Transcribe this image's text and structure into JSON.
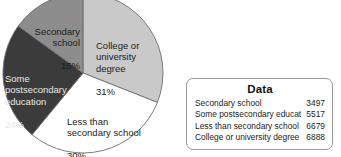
{
  "chart_data": {
    "type": "pie",
    "title": "",
    "legend_position": "labels-on-slices",
    "categories": [
      "College or university degree",
      "Less than secondary school",
      "Some postsecondary education",
      "Secondary school"
    ],
    "values": [
      31,
      30,
      24,
      15
    ],
    "value_unit": "percent",
    "counts": [
      6888,
      6679,
      5517,
      3497
    ],
    "slices": [
      {
        "label": "College or\nuniversity\ndegree",
        "label_flat": "College or university degree",
        "percent_text": "31%",
        "percent": 31,
        "count": 6888,
        "color": "#c9c9c9",
        "start_angle": 0,
        "end_angle": 111.6,
        "text_color": "dark"
      },
      {
        "label": "Less than\nsecondary school",
        "label_flat": "Less than secondary school",
        "percent_text": "30%",
        "percent": 30,
        "count": 6679,
        "color": "#ffffff",
        "start_angle": 111.6,
        "end_angle": 219.6,
        "text_color": "dark"
      },
      {
        "label": "Some\npostsecondary\neducation",
        "label_flat": "Some postsecondary education",
        "percent_text": "24%",
        "percent": 24,
        "count": 5517,
        "color": "#3b3b3b",
        "start_angle": 219.6,
        "end_angle": 306.0,
        "text_color": "light"
      },
      {
        "label": "Secondary\nschool",
        "label_flat": "Secondary school",
        "percent_text": "15%",
        "percent": 15,
        "count": 3497,
        "color": "#8d8d8d",
        "start_angle": 306.0,
        "end_angle": 360,
        "text_color": "dark"
      }
    ],
    "outline_color": "#6e6e6e"
  },
  "data_panel": {
    "title": "Data",
    "rows": [
      {
        "label": "Secondary school",
        "value": "3497"
      },
      {
        "label": "Some postsecondary education",
        "value": "5517"
      },
      {
        "label": "Less than secondary school",
        "value": "6679"
      },
      {
        "label": "College or university degree",
        "value": "6888"
      }
    ]
  }
}
